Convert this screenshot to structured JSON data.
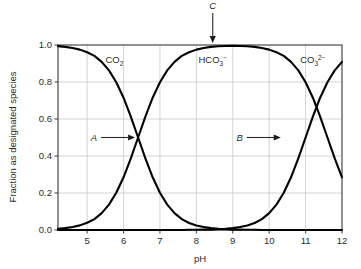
{
  "figure": {
    "name": "carbonate-speciation-diagram",
    "background_color": "#ffffff",
    "curve_color": "#000000",
    "grid_color": "#c9c9c9",
    "axis_color": "#3a3a3a",
    "text_color": "#2b2b2b"
  },
  "axes": {
    "x": {
      "label": "pH",
      "min": 4.2,
      "max": 12,
      "ticks": [
        5,
        6,
        7,
        8,
        9,
        10,
        11,
        12
      ],
      "tick_labels": [
        "5",
        "6",
        "7",
        "8",
        "9",
        "10",
        "11",
        "12"
      ]
    },
    "y": {
      "label": "Fraction as designated species",
      "min": 0.0,
      "max": 1.0,
      "ticks": [
        0.0,
        0.2,
        0.4,
        0.6,
        0.8,
        1.0
      ],
      "tick_labels": [
        "0.0",
        "0.2",
        "0.4",
        "0.6",
        "0.8",
        "1.0"
      ]
    },
    "grid": "both"
  },
  "species_labels": [
    {
      "id": "co2",
      "text": "CO",
      "sub": "2",
      "sup": "",
      "x": 5.75,
      "y": 0.92
    },
    {
      "id": "hco3",
      "text": "HCO",
      "sub": "3",
      "sup": "−",
      "x": 8.45,
      "y": 0.92
    },
    {
      "id": "co3",
      "text": "CO",
      "sub": "3",
      "sup": "2−",
      "x": 11.2,
      "y": 0.92
    }
  ],
  "annotations": [
    {
      "id": "A",
      "label": "A",
      "target_x": 6.4,
      "target_y": 0.5,
      "direction": "right"
    },
    {
      "id": "B",
      "label": "B",
      "target_x": 10.4,
      "target_y": 0.5,
      "direction": "right"
    },
    {
      "id": "C",
      "label": "C",
      "target_x": 8.45,
      "target_y": 1.0,
      "direction": "down"
    }
  ],
  "chart_data": {
    "type": "line",
    "title": "",
    "xlabel": "pH",
    "ylabel": "Fraction as designated species",
    "xlim": [
      4.2,
      12
    ],
    "ylim": [
      0.0,
      1.0
    ],
    "grid": true,
    "legend": "none",
    "pka1": 6.4,
    "pka2": 10.4,
    "x": [
      4.2,
      4.4,
      4.6,
      4.8,
      5.0,
      5.2,
      5.4,
      5.6,
      5.8,
      6.0,
      6.2,
      6.4,
      6.6,
      6.8,
      7.0,
      7.2,
      7.4,
      7.6,
      7.8,
      8.0,
      8.2,
      8.4,
      8.6,
      8.8,
      9.0,
      9.2,
      9.4,
      9.6,
      9.8,
      10.0,
      10.2,
      10.4,
      10.6,
      10.8,
      11.0,
      11.2,
      11.4,
      11.6,
      11.8,
      12.0
    ],
    "series": [
      {
        "name": "CO2",
        "label_text": "CO2",
        "values": [
          0.994,
          0.99,
          0.984,
          0.975,
          0.961,
          0.941,
          0.909,
          0.863,
          0.799,
          0.715,
          0.613,
          0.5,
          0.387,
          0.285,
          0.201,
          0.137,
          0.091,
          0.059,
          0.038,
          0.024,
          0.016,
          0.01,
          0.006,
          0.004,
          0.002,
          0.002,
          0.001,
          0.001,
          0.0,
          0.0,
          0.0,
          0.0,
          0.0,
          0.0,
          0.0,
          0.0,
          0.0,
          0.0,
          0.0,
          0.0
        ]
      },
      {
        "name": "HCO3-",
        "label_text": "HCO3-",
        "values": [
          0.006,
          0.01,
          0.016,
          0.025,
          0.039,
          0.059,
          0.091,
          0.137,
          0.201,
          0.285,
          0.387,
          0.5,
          0.613,
          0.715,
          0.799,
          0.863,
          0.909,
          0.941,
          0.961,
          0.975,
          0.984,
          0.99,
          0.993,
          0.995,
          0.996,
          0.995,
          0.993,
          0.99,
          0.984,
          0.975,
          0.961,
          0.941,
          0.909,
          0.863,
          0.799,
          0.715,
          0.613,
          0.5,
          0.387,
          0.285
        ]
      },
      {
        "name": "CO3 2-",
        "label_text": "CO3 2-",
        "values": [
          0.0,
          0.0,
          0.0,
          0.0,
          0.0,
          0.0,
          0.0,
          0.0,
          0.0,
          0.0,
          0.0,
          0.0,
          0.0,
          0.0,
          0.0,
          0.0,
          0.0,
          0.0,
          0.001,
          0.001,
          0.002,
          0.002,
          0.004,
          0.006,
          0.01,
          0.016,
          0.024,
          0.038,
          0.059,
          0.091,
          0.137,
          0.201,
          0.285,
          0.387,
          0.5,
          0.613,
          0.715,
          0.799,
          0.863,
          0.909
        ]
      }
    ]
  }
}
